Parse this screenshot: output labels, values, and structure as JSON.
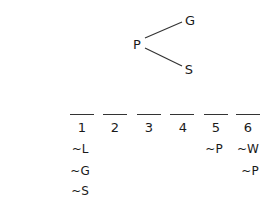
{
  "diagram": {
    "root": "P",
    "branches": [
      "G",
      "S"
    ]
  },
  "slots": [
    {
      "number": "1",
      "constraints": [
        "~L",
        "~G",
        "~S"
      ]
    },
    {
      "number": "2",
      "constraints": []
    },
    {
      "number": "3",
      "constraints": []
    },
    {
      "number": "4",
      "constraints": []
    },
    {
      "number": "5",
      "constraints": [
        "~P"
      ]
    },
    {
      "number": "6",
      "constraints": [
        "~W",
        "~P"
      ]
    }
  ]
}
